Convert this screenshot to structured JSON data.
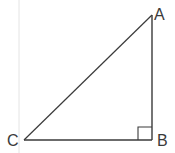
{
  "diagram": {
    "type": "right-triangle",
    "vertices": [
      {
        "label": "A",
        "x": 152,
        "y": 15
      },
      {
        "label": "B",
        "x": 152,
        "y": 140
      },
      {
        "label": "C",
        "x": 24,
        "y": 140
      }
    ],
    "right_angle_at": "B",
    "colors": {
      "stroke": "#3a3a3a",
      "guide": "#e2e2e2"
    }
  }
}
